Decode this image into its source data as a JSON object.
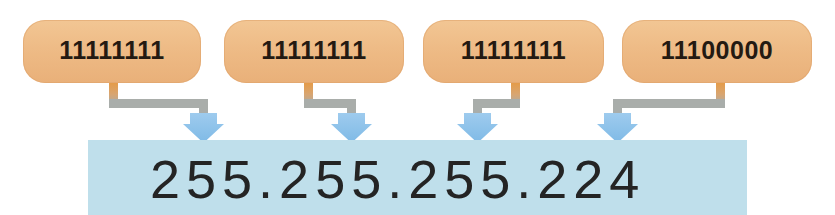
{
  "diagram": {
    "colors": {
      "box_fill": "#eeba85",
      "box_fill_light": "#f2c694",
      "box_fill_dark": "#e9b079",
      "connector_orange": "#e8993f",
      "connector_gray": "#a9adaa",
      "arrow_blue": "#8ec4ea",
      "arrow_blue_light": "#bfdcf3",
      "band_blue": "#bfdfeb",
      "text_dark": "#241a12",
      "result_text": "#242424",
      "background": "#ffffff"
    },
    "octets": [
      {
        "binary": "11111111",
        "decimal": "255"
      },
      {
        "binary": "11111111",
        "decimal": "255"
      },
      {
        "binary": "11111111",
        "decimal": "255"
      },
      {
        "binary": "11100000",
        "decimal": "224"
      }
    ],
    "result": {
      "value": "255.255.255.224"
    },
    "connectors": [
      {
        "direction": "right",
        "from_octet": 1
      },
      {
        "direction": "right",
        "from_octet": 2
      },
      {
        "direction": "left",
        "from_octet": 3
      },
      {
        "direction": "left",
        "from_octet": 4
      }
    ]
  }
}
